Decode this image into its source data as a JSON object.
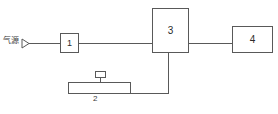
{
  "diagram": {
    "line_color": "#595959",
    "text_color": "#2b2b2b",
    "background": "#ffffff",
    "source": {
      "label": "气源",
      "marker": "arrow-right-marker"
    },
    "components": [
      {
        "id": "1",
        "label": "1",
        "name": "component-1"
      },
      {
        "id": "2",
        "label": "2",
        "name": "component-2"
      },
      {
        "id": "3",
        "label": "3",
        "name": "component-3"
      },
      {
        "id": "4",
        "label": "4",
        "name": "component-4"
      }
    ]
  }
}
